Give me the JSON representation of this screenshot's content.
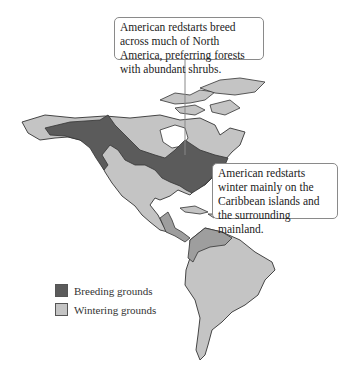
{
  "map": {
    "region": "North and South America",
    "subject": "American redstart range",
    "colors": {
      "breeding": "#5b5b5b",
      "wintering": "#c4c4c4",
      "wintering_dark": "#9e9e9e",
      "outline": "#333333",
      "water": "#ffffff"
    }
  },
  "callouts": {
    "breeding": "American redstarts breed across much of North America, preferring forests with abundant shrubs.",
    "wintering": "American redstarts winter mainly on the Caribbean islands and the surrounding mainland."
  },
  "legend": {
    "items": [
      {
        "label": "Breeding grounds",
        "color": "#5b5b5b"
      },
      {
        "label": "Wintering grounds",
        "color": "#c4c4c4"
      }
    ]
  }
}
